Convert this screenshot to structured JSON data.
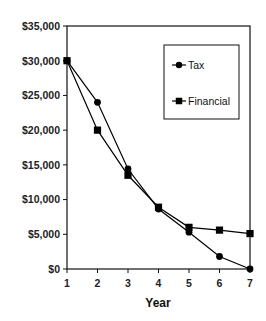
{
  "chart_data": {
    "type": "line",
    "title": "",
    "xlabel": "Year",
    "ylabel": "",
    "x": [
      1,
      2,
      3,
      4,
      5,
      6,
      7
    ],
    "ylim": [
      0,
      35000
    ],
    "xlim": [
      1,
      7
    ],
    "yticks": [
      0,
      5000,
      10000,
      15000,
      20000,
      25000,
      30000,
      35000
    ],
    "ytick_labels": [
      "$0",
      "$5,000",
      "$10,000",
      "$15,000",
      "$20,000",
      "$25,000",
      "$30,000",
      "$35,000"
    ],
    "xtick_labels": [
      "1",
      "2",
      "3",
      "4",
      "5",
      "6",
      "7"
    ],
    "grid": false,
    "legend_position": "upper right (inside plot)",
    "series": [
      {
        "name": "Tax",
        "marker": "circle",
        "color": "#000000",
        "values": [
          30000,
          24000,
          14400,
          8640,
          5300,
          1800,
          0
        ]
      },
      {
        "name": "Financial",
        "marker": "square",
        "color": "#000000",
        "values": [
          30000,
          20000,
          13500,
          8900,
          6000,
          5600,
          5100
        ]
      }
    ]
  },
  "legend": {
    "items": [
      {
        "label": "Tax",
        "marker": "circle"
      },
      {
        "label": "Financial",
        "marker": "square"
      }
    ]
  },
  "axes": {
    "x_title": "Year"
  }
}
